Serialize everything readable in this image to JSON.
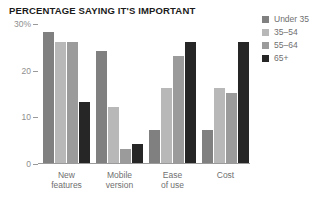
{
  "chart_data": {
    "type": "bar",
    "title": "PERCENTAGE SAYING IT'S IMPORTANT",
    "xlabel": "",
    "ylabel": "",
    "ylim": [
      0,
      30
    ],
    "yticks": [
      {
        "value": 30,
        "label": "30%"
      },
      {
        "value": 20,
        "label": "20"
      },
      {
        "value": 10,
        "label": "10"
      },
      {
        "value": 0,
        "label": "0"
      }
    ],
    "grid": false,
    "legend_position": "right",
    "categories": [
      "New\nfeatures",
      "Mobile\nversion",
      "Ease\nof use",
      "Cost"
    ],
    "series": [
      {
        "name": "Under 35",
        "color": "#808080",
        "values": [
          28,
          24,
          7,
          7
        ]
      },
      {
        "name": "35–54",
        "color": "#b8b8b8",
        "values": [
          26,
          12,
          16,
          16
        ]
      },
      {
        "name": "55–64",
        "color": "#9b9b9b",
        "values": [
          26,
          3,
          23,
          15
        ]
      },
      {
        "name": "65+",
        "color": "#262626",
        "values": [
          13,
          4,
          26,
          26
        ]
      }
    ]
  },
  "colors": {
    "title": "#1b1b1b",
    "axis": "#9a9a9a",
    "tick_text": "#8e8e8e",
    "label_text": "#6f6f6f",
    "background": "#ffffff"
  }
}
